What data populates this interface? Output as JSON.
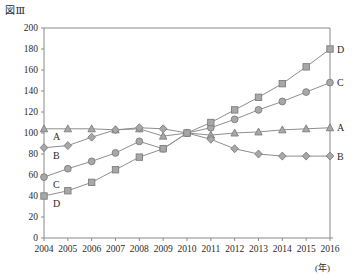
{
  "figure": {
    "title": "図Ⅲ",
    "x_unit_label": "(年)"
  },
  "chart_data": {
    "type": "line",
    "title": "図Ⅲ",
    "xlabel": "(年)",
    "ylabel": "",
    "xlim": [
      2004,
      2016
    ],
    "ylim": [
      0,
      200
    ],
    "ytick_step": 20,
    "grid": false,
    "legend_position": "right-end-of-line",
    "base_year": 2010,
    "base_value": 100,
    "categories": [
      2004,
      2005,
      2006,
      2007,
      2008,
      2009,
      2010,
      2011,
      2012,
      2013,
      2014,
      2015,
      2016
    ],
    "yticks": [
      0,
      20,
      40,
      60,
      80,
      100,
      120,
      140,
      160,
      180,
      200
    ],
    "xticks": [
      "2004",
      "2005",
      "2006",
      "2007",
      "2008",
      "2009",
      "2010",
      "2011",
      "2012",
      "2013",
      "2014",
      "2015",
      "2016"
    ],
    "series": [
      {
        "name": "A",
        "marker": "triangle",
        "left_label": "A",
        "right_label": "A",
        "values": [
          104,
          104,
          104,
          103,
          104,
          97,
          100,
          98,
          100,
          101,
          103,
          104,
          105
        ]
      },
      {
        "name": "B",
        "marker": "diamond",
        "left_label": "B",
        "right_label": "B",
        "values": [
          86,
          88,
          96,
          103,
          105,
          104,
          100,
          94,
          85,
          80,
          78,
          78,
          78
        ]
      },
      {
        "name": "C",
        "marker": "circle",
        "left_label": "C",
        "right_label": "C",
        "values": [
          58,
          66,
          73,
          81,
          92,
          85,
          100,
          105,
          113,
          122,
          130,
          139,
          148
        ]
      },
      {
        "name": "D",
        "marker": "square",
        "left_label": "D",
        "right_label": "D",
        "values": [
          40,
          45,
          53,
          65,
          77,
          85,
          100,
          110,
          122,
          134,
          147,
          163,
          180
        ]
      }
    ]
  },
  "colors": {
    "axis": "#8a8a8a",
    "line": "#8e8e8e",
    "marker_fill": "#a8a8a8",
    "marker_stroke": "#7d7d7d",
    "text": "#2b2b2b",
    "background": "#ffffff"
  }
}
